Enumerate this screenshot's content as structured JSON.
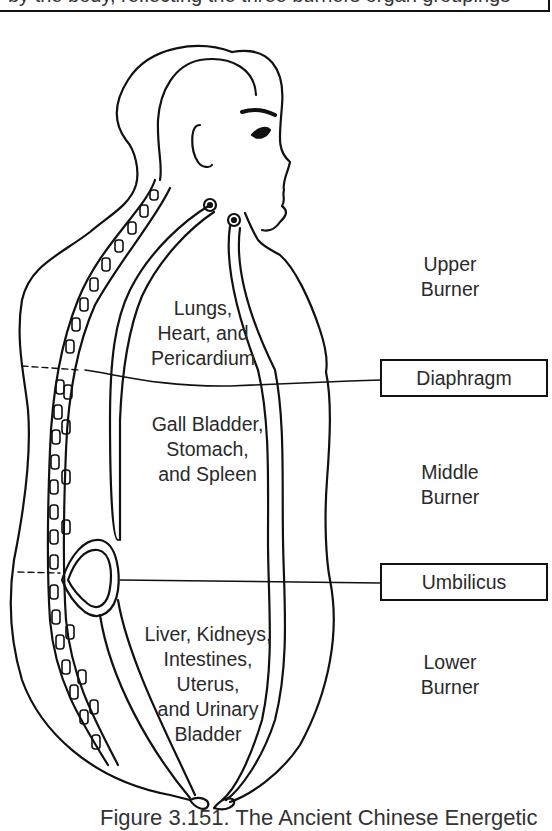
{
  "top_box": {
    "text": "by the body, reflecting the three burners organ groupings"
  },
  "regions": {
    "upper": {
      "organs": [
        "Lungs,",
        "Heart, and",
        "Pericardium"
      ],
      "burner": [
        "Upper",
        "Burner"
      ]
    },
    "middle": {
      "organs": [
        "Gall Bladder,",
        "Stomach,",
        "and Spleen"
      ],
      "burner": [
        "Middle",
        "Burner"
      ]
    },
    "lower": {
      "organs": [
        "Liver, Kidneys,",
        "Intestines,",
        "Uterus,",
        "and Urinary",
        "Bladder"
      ],
      "burner": [
        "Lower",
        "Burner"
      ]
    }
  },
  "markers": {
    "diaphragm": "Diaphragm",
    "umbilicus": "Umbilicus"
  },
  "caption": "Figure 3.151. The Ancient Chinese Energetic"
}
